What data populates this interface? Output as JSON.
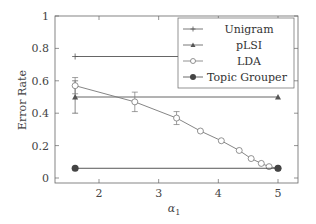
{
  "chart_data": {
    "type": "line",
    "title": "",
    "xlabel": "α1",
    "ylabel": "Error Rate",
    "xlim": [
      1.35,
      5.35
    ],
    "ylim": [
      -0.03,
      1.0
    ],
    "xticks": [
      2,
      3,
      4,
      5
    ],
    "yticks": [
      0,
      0.2,
      0.4,
      0.6,
      0.8,
      1
    ],
    "ytick_labels": [
      "0",
      "0.2",
      "0.4",
      "0.6",
      "0.8",
      "1"
    ],
    "xtick_labels": [
      "2",
      "3",
      "4",
      "5"
    ],
    "grid": false,
    "legend_position": "upper right",
    "series": [
      {
        "name": "Unigram",
        "marker": "plus",
        "color": "#555555",
        "x": [
          1.6,
          5.0
        ],
        "y": [
          0.75,
          0.75
        ]
      },
      {
        "name": "pLSI",
        "marker": "triangle",
        "color": "#555555",
        "x": [
          1.6,
          5.0
        ],
        "y": [
          0.5,
          0.5
        ],
        "error": [
          0.1,
          0.0
        ]
      },
      {
        "name": "LDA",
        "marker": "circle-open",
        "color": "#777777",
        "x": [
          1.6,
          2.6,
          3.3,
          3.7,
          4.05,
          4.35,
          4.55,
          4.72,
          4.85,
          5.0
        ],
        "y": [
          0.57,
          0.47,
          0.37,
          0.29,
          0.23,
          0.17,
          0.12,
          0.09,
          0.07,
          0.06
        ],
        "error": [
          0.05,
          0.06,
          0.04,
          0,
          0,
          0,
          0,
          0,
          0,
          0
        ]
      },
      {
        "name": "Topic Grouper",
        "marker": "circle-filled",
        "color": "#444444",
        "x": [
          1.6,
          5.0
        ],
        "y": [
          0.06,
          0.06
        ]
      }
    ]
  },
  "legend": {
    "items": [
      "Unigram",
      "pLSI",
      "LDA",
      "Topic Grouper"
    ]
  },
  "axes": {
    "xlabel": "α",
    "xlabel_sub": "1",
    "ylabel": "Error Rate"
  }
}
